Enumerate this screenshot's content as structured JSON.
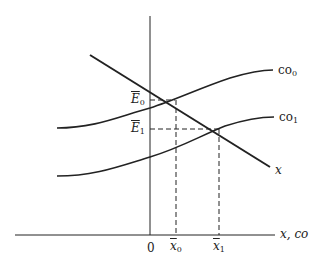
{
  "diagram": {
    "type": "economics-equilibrium-diagram",
    "axes": {
      "horizontal_label": "x, co",
      "origin_label": "0"
    },
    "curves": [
      {
        "id": "x",
        "label": "x",
        "shape": "downward-sloping line"
      },
      {
        "id": "co0",
        "label": "co",
        "subscript": "0",
        "shape": "upward S-curve"
      },
      {
        "id": "co1",
        "label": "co",
        "subscript": "1",
        "shape": "upward S-curve (lower)"
      }
    ],
    "equilibria": [
      {
        "y_label": "E",
        "y_sub": "0",
        "x_label": "x",
        "x_sub": "0"
      },
      {
        "y_label": "E",
        "y_sub": "1",
        "x_label": "x",
        "x_sub": "1"
      }
    ],
    "colors": {
      "line": "#222222",
      "background": "#ffffff"
    }
  }
}
